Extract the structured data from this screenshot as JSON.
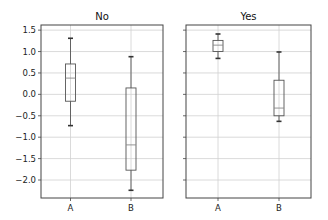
{
  "chart_data": {
    "type": "boxplot",
    "layout": {
      "subplots": 2,
      "sharey": true,
      "grid": true
    },
    "ylim": [
      -2.42,
      1.62
    ],
    "yticks": [
      1.5,
      1.0,
      0.5,
      0.0,
      -0.5,
      -1.0,
      -1.5,
      -2.0
    ],
    "ytick_labels": [
      "1.5",
      "1.0",
      "0.5",
      "0.0",
      "−0.5",
      "−1.0",
      "−1.5",
      "−2.0"
    ],
    "categories": [
      "A",
      "B"
    ],
    "panels": [
      {
        "title": "No",
        "boxes": [
          {
            "label": "A",
            "whisker_low": -0.73,
            "q1": -0.16,
            "median": 0.38,
            "q3": 0.71,
            "whisker_high": 1.31
          },
          {
            "label": "B",
            "whisker_low": -2.24,
            "q1": -1.77,
            "median": -1.18,
            "q3": 0.15,
            "whisker_high": 0.88
          }
        ]
      },
      {
        "title": "Yes",
        "boxes": [
          {
            "label": "A",
            "whisker_low": 0.84,
            "q1": 1.0,
            "median": 1.15,
            "q3": 1.26,
            "whisker_high": 1.41
          },
          {
            "label": "B",
            "whisker_low": -0.63,
            "q1": -0.5,
            "median": -0.32,
            "q3": 0.33,
            "whisker_high": 0.99
          }
        ]
      }
    ],
    "xlabel": "",
    "ylabel": ""
  },
  "colors": {
    "frame": "#444444",
    "grid": "#d0d0d0",
    "box": "#555555",
    "median": "#888888"
  }
}
